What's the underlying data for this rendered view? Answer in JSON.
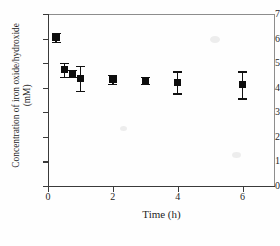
{
  "chart_data": {
    "type": "scatter",
    "title": "",
    "xlabel": "Time (h)",
    "ylabel": "Concentration of iron oxide/hydroxide (mM)",
    "ylabel_line1": "Concentration of iron oxide/hydroxide",
    "ylabel_line2": "(mM)",
    "xlim": [
      0,
      7
    ],
    "ylim": [
      0,
      7
    ],
    "grid": false,
    "legend": "none",
    "marker": "filled-square",
    "marker_color": "#0d0d0d",
    "errorbars": true,
    "xticks": [
      0,
      2,
      4,
      6
    ],
    "xticklabels": [
      "0",
      "2",
      "4",
      "6"
    ],
    "yticks": [
      0,
      1,
      2,
      3,
      4,
      5,
      6,
      7
    ],
    "yticklabels": [
      "0",
      "1",
      "2",
      "3",
      "4",
      "5",
      "6",
      "7"
    ],
    "series": [
      {
        "name": "iron oxide/hydroxide",
        "x": [
          0.25,
          0.5,
          0.75,
          1.0,
          2.0,
          3.0,
          4.0,
          6.0
        ],
        "y": [
          6.05,
          4.73,
          4.58,
          4.38,
          4.35,
          4.3,
          4.22,
          4.12
        ],
        "yerr": [
          0.17,
          0.28,
          0.15,
          0.52,
          0.18,
          0.15,
          0.45,
          0.55
        ]
      }
    ]
  }
}
